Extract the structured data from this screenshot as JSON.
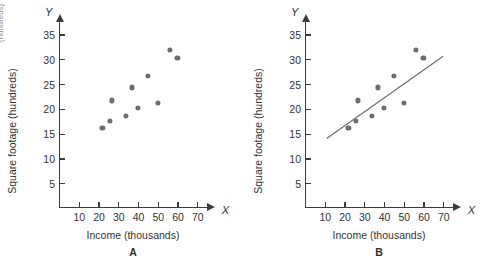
{
  "figure": {
    "bleed_text_fragment": "(hundreds)",
    "axis_letter_y": "Y",
    "axis_letter_x": "X",
    "ylabel": "Square footage (hundreds)",
    "xlabel": "Income (thousands)",
    "y_ticks": [
      5,
      10,
      15,
      20,
      25,
      30,
      35
    ],
    "x_ticks": [
      10,
      20,
      30,
      40,
      50,
      60,
      70
    ],
    "point_color": "#6e6e6e",
    "axis_color": "#3c3c3c",
    "line_color": "#6e6e6e",
    "panels": [
      {
        "caption": "A"
      },
      {
        "caption": "B"
      }
    ]
  },
  "chart_data": [
    {
      "type": "scatter",
      "title": "A",
      "xlabel": "Income (thousands)",
      "ylabel": "Square footage (hundreds)",
      "xlim": [
        0,
        75
      ],
      "ylim": [
        0,
        37.5
      ],
      "xticks": [
        10,
        20,
        30,
        40,
        50,
        60,
        70
      ],
      "yticks": [
        5,
        10,
        15,
        20,
        25,
        30,
        35
      ],
      "grid": false,
      "legend": "none",
      "x": [
        22,
        26,
        27,
        34,
        37,
        40,
        45,
        50,
        56,
        60
      ],
      "y": [
        16.1,
        17.5,
        21.7,
        18.5,
        24.3,
        20.1,
        26.7,
        21.2,
        31.8,
        30.3
      ],
      "annotations": []
    },
    {
      "type": "scatter",
      "title": "B",
      "xlabel": "Income (thousands)",
      "ylabel": "Square footage (hundreds)",
      "xlim": [
        0,
        75
      ],
      "ylim": [
        0,
        37.5
      ],
      "xticks": [
        10,
        20,
        30,
        40,
        50,
        60,
        70
      ],
      "yticks": [
        5,
        10,
        15,
        20,
        25,
        30,
        35
      ],
      "grid": false,
      "legend": "none",
      "x": [
        22,
        26,
        27,
        34,
        37,
        40,
        45,
        50,
        56,
        60
      ],
      "y": [
        16.1,
        17.5,
        21.7,
        18.5,
        24.3,
        20.1,
        26.7,
        21.2,
        31.8,
        30.3
      ],
      "fit_line": {
        "x": [
          11,
          70
        ],
        "y": [
          14.0,
          30.6
        ]
      },
      "annotations": []
    }
  ]
}
